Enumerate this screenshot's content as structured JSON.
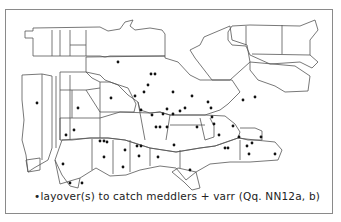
{
  "map": {
    "title": "Dot map of eastern United States",
    "caption": "•layover(s) to catch meddlers + varr  (Qq. NN12a, b)",
    "colors": {
      "border": "#555555",
      "dot": "#111111",
      "frame": "#8a8a8a"
    },
    "dots": [
      [
        118,
        62
      ],
      [
        151,
        74
      ],
      [
        155,
        74
      ],
      [
        148,
        85
      ],
      [
        144,
        92
      ],
      [
        135,
        96
      ],
      [
        111,
        98
      ],
      [
        141,
        110
      ],
      [
        173,
        92
      ],
      [
        152,
        115
      ],
      [
        163,
        114
      ],
      [
        167,
        109
      ],
      [
        173,
        114
      ],
      [
        156,
        127
      ],
      [
        160,
        127
      ],
      [
        167,
        127
      ],
      [
        192,
        96
      ],
      [
        208,
        102
      ],
      [
        211,
        108
      ],
      [
        212,
        117
      ],
      [
        197,
        127
      ],
      [
        180,
        111
      ],
      [
        185,
        108
      ],
      [
        214,
        124
      ],
      [
        219,
        135
      ],
      [
        233,
        126
      ],
      [
        239,
        137
      ],
      [
        261,
        137
      ],
      [
        225,
        148
      ],
      [
        228,
        148
      ],
      [
        247,
        146
      ],
      [
        252,
        143
      ],
      [
        275,
        154
      ],
      [
        249,
        154
      ],
      [
        243,
        100
      ],
      [
        255,
        97
      ],
      [
        37,
        103
      ],
      [
        78,
        108
      ],
      [
        74,
        130
      ],
      [
        66,
        135
      ],
      [
        100,
        141
      ],
      [
        104,
        141
      ],
      [
        104,
        157
      ],
      [
        125,
        150
      ],
      [
        137,
        146
      ],
      [
        141,
        146
      ],
      [
        139,
        156
      ],
      [
        158,
        157
      ],
      [
        174,
        145
      ],
      [
        190,
        170
      ],
      [
        63,
        164
      ],
      [
        70,
        183
      ],
      [
        82,
        183
      ],
      [
        107,
        142
      ],
      [
        123,
        167
      ]
    ]
  }
}
